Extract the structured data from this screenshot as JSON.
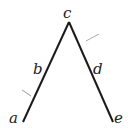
{
  "diagram": {
    "type": "inverted-v",
    "labels": {
      "apex": "c",
      "left_mid": "b",
      "right_mid": "d",
      "left_end": "a",
      "right_end": "e"
    },
    "colors": {
      "line": "#1a1a1a",
      "tick": "#999999",
      "background": "#ffffff"
    }
  }
}
